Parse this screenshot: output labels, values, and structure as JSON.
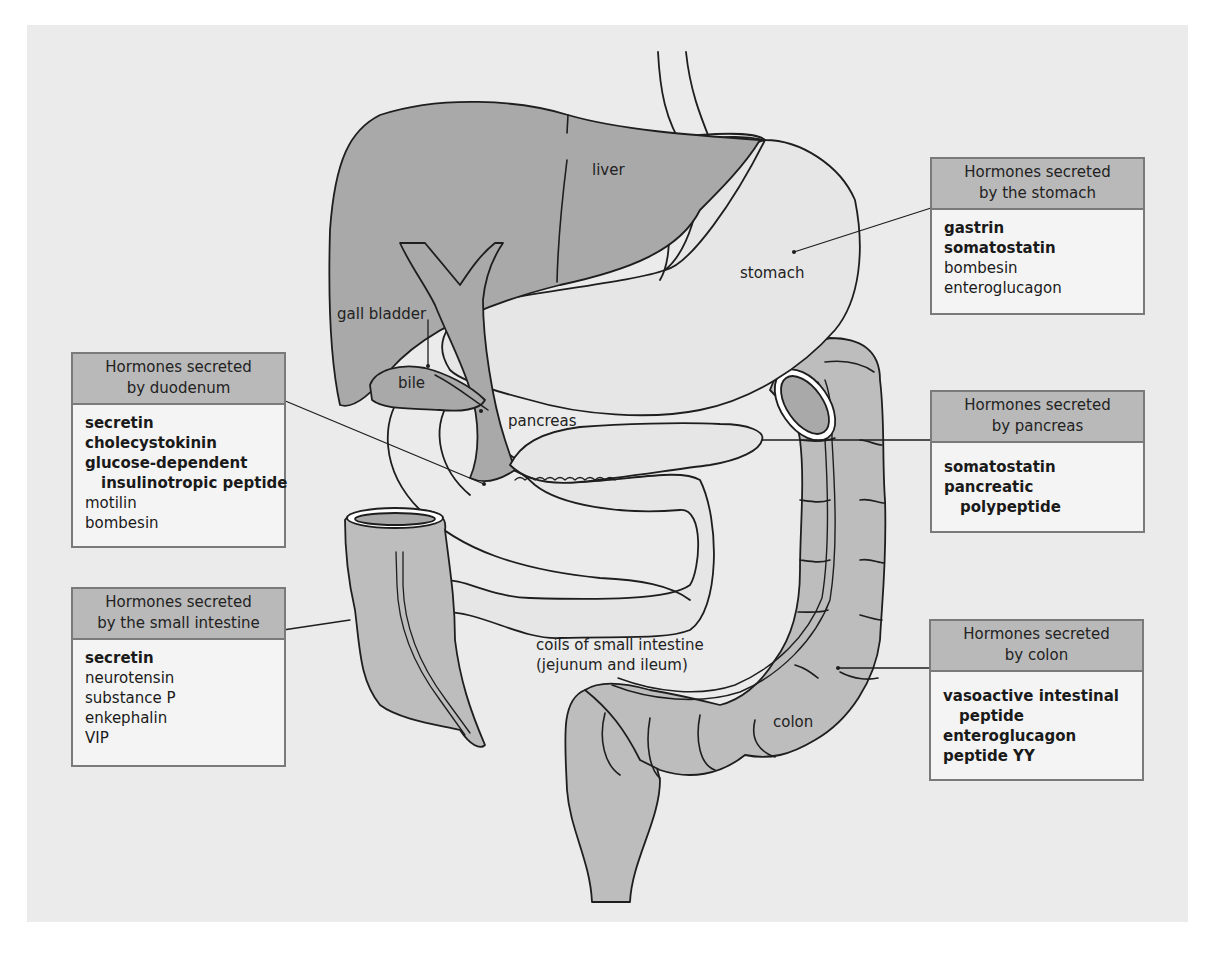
{
  "diagram": {
    "colors": {
      "background": "#ebebeb",
      "organ_dark": "#a9a9a9",
      "organ_mid": "#bdbdbd",
      "organ_light": "#e6e6e6",
      "box_header": "#b9b9b9",
      "box_body": "#f4f4f4",
      "outline": "#1e1e1e"
    },
    "organ_labels": {
      "liver": "liver",
      "stomach": "stomach",
      "gall_bladder": "gall bladder",
      "bile": "bile",
      "pancreas": "pancreas",
      "small_intestine_line1": "coils of small intestine",
      "small_intestine_line2": "(jejunum and ileum)",
      "colon": "colon"
    },
    "boxes": {
      "stomach": {
        "header_line1": "Hormones secreted",
        "header_line2": "by the stomach",
        "items": [
          {
            "text": "gastrin",
            "bold": true
          },
          {
            "text": "somatostatin",
            "bold": true
          },
          {
            "text": "bombesin",
            "bold": false
          },
          {
            "text": "enteroglucagon",
            "bold": false
          }
        ]
      },
      "duodenum": {
        "header_line1": "Hormones secreted",
        "header_line2": "by duodenum",
        "items": [
          {
            "text": "secretin",
            "bold": true
          },
          {
            "text": "cholecystokinin",
            "bold": true
          },
          {
            "text": "glucose-dependent",
            "bold": true
          },
          {
            "text": "insulinotropic peptide",
            "bold": true,
            "indent": true
          },
          {
            "text": "motilin",
            "bold": false
          },
          {
            "text": "bombesin",
            "bold": false
          }
        ]
      },
      "pancreas": {
        "header_line1": "Hormones secreted",
        "header_line2": "by pancreas",
        "items": [
          {
            "text": "somatostatin",
            "bold": true
          },
          {
            "text": "pancreatic",
            "bold": true
          },
          {
            "text": "polypeptide",
            "bold": true,
            "indent": true
          }
        ]
      },
      "small_intestine": {
        "header_line1": "Hormones secreted",
        "header_line2": "by the small intestine",
        "items": [
          {
            "text": "secretin",
            "bold": true
          },
          {
            "text": "neurotensin",
            "bold": false
          },
          {
            "text": "substance P",
            "bold": false
          },
          {
            "text": "enkephalin",
            "bold": false
          },
          {
            "text": "VIP",
            "bold": false
          }
        ]
      },
      "colon": {
        "header_line1": "Hormones secreted",
        "header_line2": "by colon",
        "items": [
          {
            "text": "vasoactive intestinal",
            "bold": true
          },
          {
            "text": "peptide",
            "bold": true,
            "indent": true
          },
          {
            "text": "enteroglucagon",
            "bold": true
          },
          {
            "text": "peptide YY",
            "bold": true
          }
        ]
      }
    }
  }
}
